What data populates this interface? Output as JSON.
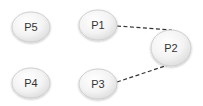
{
  "diagram": {
    "nodes": [
      {
        "id": "P5",
        "label": "P5",
        "cx": 31,
        "cy": 27,
        "rx": 19,
        "ry": 15
      },
      {
        "id": "P1",
        "label": "P1",
        "cx": 98,
        "cy": 25,
        "rx": 19,
        "ry": 15
      },
      {
        "id": "P2",
        "label": "P2",
        "cx": 171,
        "cy": 48,
        "rx": 20,
        "ry": 18
      },
      {
        "id": "P4",
        "label": "P4",
        "cx": 31,
        "cy": 83,
        "rx": 19,
        "ry": 15
      },
      {
        "id": "P3",
        "label": "P3",
        "cx": 98,
        "cy": 84,
        "rx": 19,
        "ry": 15
      }
    ],
    "edges": [
      {
        "from": "P1",
        "to": "P2",
        "style": "dashed",
        "x1": 117,
        "y1": 26,
        "x2": 172,
        "y2": 30
      },
      {
        "from": "P3",
        "to": "P2",
        "style": "dashed",
        "x1": 117,
        "y1": 82,
        "x2": 171,
        "y2": 64
      }
    ],
    "colors": {
      "node_fill_light": "#ffffff",
      "node_fill_dark": "#e6e6e6",
      "node_stroke": "#cfcfcf",
      "edge": "#333333",
      "label": "#333333"
    }
  }
}
